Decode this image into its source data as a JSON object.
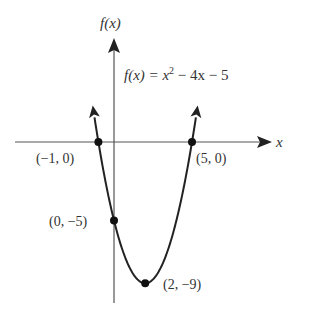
{
  "chart_data": {
    "type": "line",
    "function": "x^2 - 4x - 5",
    "xlabel": "x",
    "ylabel": "f(x)",
    "grid": false,
    "xlim": [
      -2.8,
      10
    ],
    "ylim": [
      -10,
      6.5
    ],
    "x": [
      -1.3,
      -1,
      0,
      1,
      2,
      3,
      4,
      5,
      5.3
    ],
    "y": [
      2.89,
      0,
      -5,
      -8,
      -9,
      -8,
      -5,
      0,
      2.89
    ],
    "points": [
      {
        "x": -1,
        "y": 0,
        "label": "(−1, 0)"
      },
      {
        "x": 5,
        "y": 0,
        "label": "(5, 0)"
      },
      {
        "x": 0,
        "y": -5,
        "label": "(0, −5)"
      },
      {
        "x": 2,
        "y": -9,
        "label": "(2, −9)"
      }
    ],
    "annotations": [
      "f(x) = x² − 4x − 5"
    ]
  },
  "labels": {
    "y_axis": "f(x)",
    "x_axis": "x",
    "equation_lhs": "f(x) = x",
    "equation_exp": "2",
    "equation_rhs": " − 4x − 5",
    "p1": "(−1, 0)",
    "p2": "(5, 0)",
    "p3": "(0, −5)",
    "p4": "(2, −9)"
  }
}
